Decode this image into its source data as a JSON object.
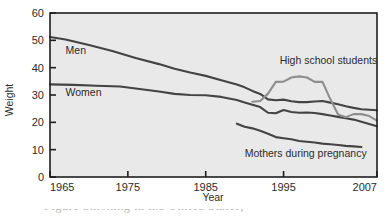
{
  "chart_data": {
    "type": "line",
    "title": "",
    "xlabel": "Year",
    "ylabel": "Weight",
    "xlim": [
      1965,
      2007
    ],
    "ylim": [
      0,
      60
    ],
    "grid": false,
    "legend_position": "inline-labels",
    "xticks": [
      "1965",
      "1975",
      "1985",
      "1995",
      "2007"
    ],
    "xtick_values": [
      1965,
      1975,
      1985,
      1995,
      2007
    ],
    "yticks": [
      "0",
      "10",
      "20",
      "30",
      "40",
      "50",
      "60"
    ],
    "ytick_values": [
      0,
      10,
      20,
      30,
      40,
      50,
      60
    ],
    "series": [
      {
        "name": "Men",
        "label": "Men",
        "color": "#434343",
        "x": [
          1965,
          1967,
          1970,
          1973,
          1976,
          1979,
          1981,
          1983,
          1985,
          1987,
          1989,
          1990,
          1991,
          1992,
          1993,
          1994,
          1995,
          1996,
          1997,
          1998,
          1999,
          2000,
          2001,
          2002,
          2003,
          2004,
          2005,
          2006,
          2007
        ],
        "values": [
          51.2,
          50.3,
          48.3,
          46.1,
          43.5,
          41.3,
          39.6,
          38.2,
          37.0,
          35.4,
          33.8,
          32.8,
          31.5,
          30.4,
          28.4,
          28.1,
          28.3,
          27.7,
          27.4,
          27.4,
          27.6,
          27.8,
          27.2,
          26.6,
          25.9,
          25.3,
          24.8,
          24.6,
          24.4
        ]
      },
      {
        "name": "Women",
        "label": "Women",
        "color": "#434343",
        "x": [
          1965,
          1968,
          1971,
          1974,
          1976,
          1979,
          1981,
          1983,
          1985,
          1987,
          1989,
          1990,
          1991,
          1992,
          1993,
          1994,
          1995,
          1996,
          1997,
          1998,
          1999,
          2000,
          2001,
          2002,
          2003,
          2004,
          2005,
          2006,
          2007
        ],
        "values": [
          33.9,
          33.7,
          33.4,
          33.1,
          32.4,
          31.3,
          30.4,
          30.0,
          29.9,
          29.3,
          28.2,
          27.3,
          26.4,
          25.6,
          23.5,
          23.3,
          24.5,
          23.8,
          23.5,
          23.6,
          23.4,
          23.0,
          22.5,
          22.0,
          21.5,
          21.0,
          20.2,
          19.4,
          18.6
        ]
      },
      {
        "name": "High school students",
        "label": "High school students",
        "color": "#8e8e8e",
        "x": [
          1991,
          1992,
          1993,
          1994,
          1995,
          1996,
          1997,
          1998,
          1999,
          2000,
          2001,
          2002,
          2003,
          2004,
          2005,
          2006,
          2007
        ],
        "values": [
          27.5,
          27.8,
          30.5,
          34.8,
          34.9,
          36.4,
          36.8,
          36.4,
          34.8,
          34.8,
          28.5,
          22.9,
          21.9,
          23.0,
          23.0,
          22.3,
          20.6
        ]
      },
      {
        "name": "Mothers during pregnancy",
        "label": "Mothers during pregnancy",
        "color": "#434343",
        "x": [
          1989,
          1990,
          1991,
          1992,
          1993,
          1994,
          1995,
          1996,
          1997,
          1998,
          1999,
          2000,
          2001,
          2002,
          2003,
          2004,
          2005
        ],
        "values": [
          19.5,
          18.4,
          17.8,
          16.9,
          15.8,
          14.6,
          14.2,
          13.8,
          13.2,
          12.9,
          12.6,
          12.2,
          12.0,
          11.7,
          11.4,
          11.2,
          11.0
        ]
      }
    ],
    "annotations": [
      {
        "text": "Men",
        "x": 1967,
        "y": 45.0
      },
      {
        "text": "Women",
        "x": 1967,
        "y": 29.5
      },
      {
        "text": "High school students",
        "x": 1994.5,
        "y": 41.5
      },
      {
        "text": "Mothers during pregnancy",
        "x": 1990.0,
        "y": 7.5
      }
    ]
  },
  "figure": {
    "plot_background": "#e9e9e9",
    "frame_color": "#1e1e1e",
    "caption_partial": "Figure     Smoking in the United States, "
  }
}
